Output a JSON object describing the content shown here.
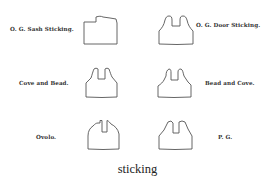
{
  "figure": {
    "caption": "sticking",
    "profiles": [
      {
        "name": "O. G. Sash Sticking.",
        "position": "top-left"
      },
      {
        "name": "O. G. Door Sticking.",
        "position": "top-right"
      },
      {
        "name": "Cove and Bead.",
        "position": "middle-left"
      },
      {
        "name": "Bead and Cove.",
        "position": "middle-right"
      },
      {
        "name": "Ovolo.",
        "position": "bottom-left"
      },
      {
        "name": "P. G.",
        "position": "bottom-right"
      }
    ],
    "colors": {
      "line": "#555555",
      "text": "#333333",
      "background": "#ffffff"
    }
  }
}
